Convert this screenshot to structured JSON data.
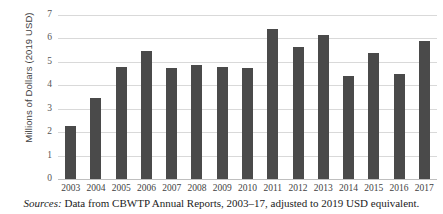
{
  "chart_data": {
    "type": "bar",
    "title": "",
    "xlabel": "",
    "ylabel": "Millions of Dollars (2019 USD)",
    "ylim": [
      0,
      7
    ],
    "yticks": [
      "7",
      "6",
      "5",
      "4",
      "3",
      "2",
      "1",
      "0"
    ],
    "grid": true,
    "legend": "none",
    "bar_color": "#4a4a4a",
    "gridline_color": "#d9d9d9",
    "categories": [
      "2003",
      "2004",
      "2005",
      "2006",
      "2007",
      "2008",
      "2009",
      "2010",
      "2011",
      "2012",
      "2013",
      "2014",
      "2015",
      "2016",
      "2017"
    ],
    "values": [
      2.25,
      3.45,
      4.78,
      5.45,
      4.73,
      4.87,
      4.78,
      4.73,
      6.4,
      5.63,
      6.13,
      4.4,
      5.37,
      4.5,
      5.9
    ]
  },
  "caption": {
    "source_word": "Sources:",
    "source_text": " Data from CBWTP Annual Reports, 2003–17, adjusted to 2019 USD equivalent."
  }
}
